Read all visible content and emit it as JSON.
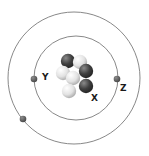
{
  "diagram": {
    "title": "",
    "type": "atom-model",
    "colors": {
      "orbit": "#777777",
      "electron": "#555555",
      "proton": "#3a3a3a",
      "neutron": "#e6e6e6",
      "label": "#1a1a1a"
    },
    "orbits": [
      {
        "name": "outer-orbit",
        "cx": 74,
        "cy": 78,
        "r": 66
      },
      {
        "name": "inner-orbit",
        "cx": 76,
        "cy": 78,
        "r": 42
      }
    ],
    "electrons": [
      {
        "name": "electron-y",
        "cx": 34,
        "cy": 79
      },
      {
        "name": "electron-z",
        "cx": 117,
        "cy": 79
      },
      {
        "name": "electron-outer",
        "cx": 23,
        "cy": 119
      }
    ],
    "nucleus": [
      {
        "kind": "proton",
        "cx": 68,
        "cy": 61
      },
      {
        "kind": "neutron",
        "cx": 80,
        "cy": 62
      },
      {
        "kind": "neutron",
        "cx": 63,
        "cy": 73
      },
      {
        "kind": "proton",
        "cx": 86,
        "cy": 71
      },
      {
        "kind": "neutron",
        "cx": 73,
        "cy": 78
      },
      {
        "kind": "proton",
        "cx": 86,
        "cy": 86
      },
      {
        "kind": "neutron",
        "cx": 69,
        "cy": 91
      }
    ],
    "labels": {
      "y": "Y",
      "z": "Z",
      "x": "X"
    }
  }
}
